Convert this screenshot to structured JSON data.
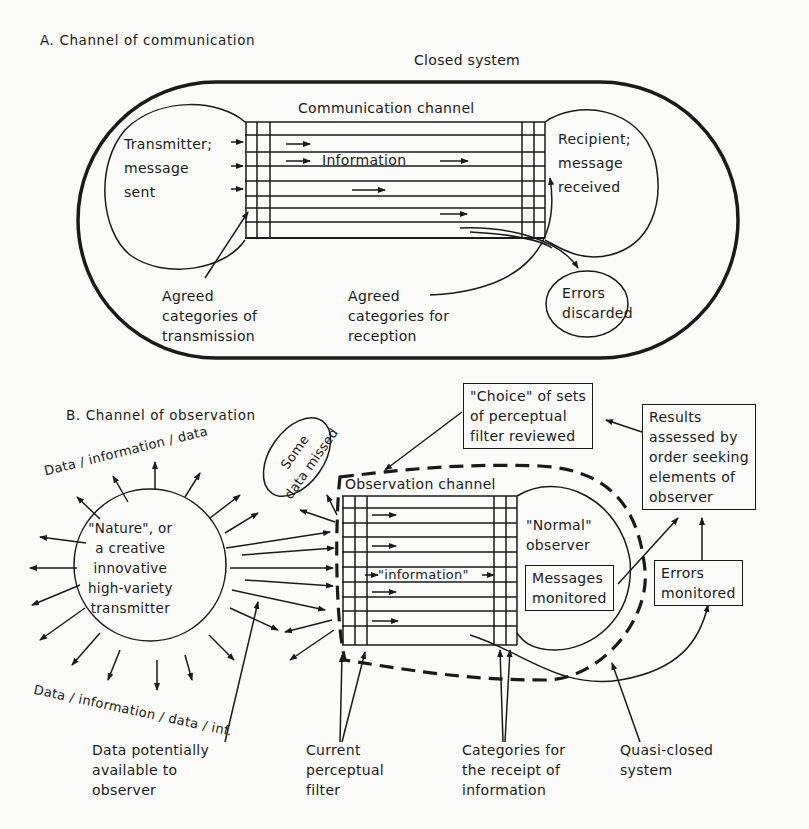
{
  "partA": {
    "title": "A. Channel of communication",
    "closed_system": "Closed system",
    "channel_label": "Communication channel",
    "transmitter": "Transmitter;\nmessage\nsent",
    "recipient": "Recipient;\nmessage\nreceived",
    "information": "Information",
    "agreed_transmission": "Agreed\ncategories of\ntransmission",
    "agreed_reception": "Agreed\ncategories for\nreception",
    "errors_discarded": "Errors\ndiscarded"
  },
  "partB": {
    "title": "B. Channel of observation",
    "data_top": "Data / information / data",
    "data_bottom": "Data / information / data / inf.",
    "nature": "\"Nature\", or\na creative\ninnovative\nhigh-variety\ntransmitter",
    "some_data_missed": "Some\ndata missed",
    "choice_box": "\"Choice\" of sets\nof perceptual\nfilter reviewed",
    "results_box": "Results\nassessed by\norder seeking\nelements of\nobserver",
    "channel_label": "Observation channel",
    "normal_observer": "\"Normal\"\nobserver",
    "information": "\"information\"",
    "messages_monitored": "Messages\nmonitored",
    "errors_monitored": "Errors\nmonitored",
    "data_potentially": "Data potentially\navailable to\nobserver",
    "current_filter": "Current\nperceptual\nfilter",
    "categories_receipt": "Categories for\nthe receipt of\ninformation",
    "quasi_closed": "Quasi-closed\nsystem"
  },
  "colors": {
    "ink": "#1a1a1a",
    "paper": "#fbfbf9"
  }
}
